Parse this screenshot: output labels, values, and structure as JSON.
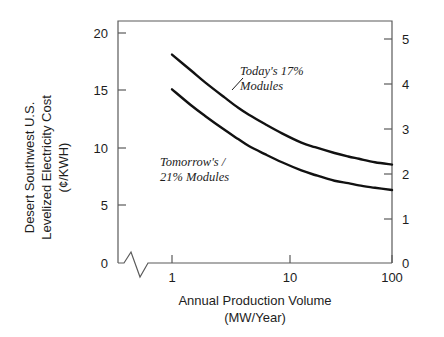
{
  "figure": {
    "axes": {
      "y_left_label_lines": [
        "Desert Southwest U.S.",
        "Levelized Electricity Cost",
        "(¢/KWH)"
      ],
      "x_label_lines": [
        "Annual Production Volume",
        "(MW/Year)"
      ],
      "y_left_ticks": [
        "0",
        "5",
        "10",
        "15",
        "20"
      ],
      "y_right_ticks": [
        "0",
        "1",
        "2",
        "3",
        "4",
        "5"
      ],
      "x_ticks": [
        "1",
        "10",
        "100"
      ]
    },
    "annotations": {
      "today_line1": "Today's 17%",
      "today_line2": "Modules",
      "tomorrow_line1": "Tomorrow's  /",
      "tomorrow_line2": "21% Modules"
    },
    "colors": {
      "ink": "#1a1a1a",
      "axis": "#555555",
      "background": "#ffffff"
    }
  },
  "chart_data": {
    "type": "line",
    "title": "",
    "xlabel": "Annual Production Volume (MW/Year)",
    "ylabel": "Desert Southwest U.S. Levelized Electricity Cost (¢/KWH)",
    "xscale": "log",
    "xlim": [
      1,
      100
    ],
    "ylim": [
      0,
      20
    ],
    "y2lim": [
      0,
      5
    ],
    "y2label": "",
    "xticks": [
      1,
      10,
      100
    ],
    "yticks": [
      0,
      5,
      10,
      15,
      20
    ],
    "y2ticks": [
      0,
      1,
      2,
      3,
      4,
      5
    ],
    "grid": false,
    "legend": "annotations-inline",
    "axis_break": {
      "axis": "x",
      "near": "origin",
      "style": "zigzag"
    },
    "x": [
      1,
      1.5,
      2,
      3,
      4,
      5,
      7,
      10,
      15,
      20,
      30,
      40,
      50,
      70,
      100
    ],
    "series": [
      {
        "name": "Today's 17% Modules",
        "values": [
          18.0,
          16.6,
          15.6,
          14.3,
          13.4,
          12.8,
          12.0,
          11.2,
          10.4,
          10.0,
          9.5,
          9.2,
          9.0,
          8.7,
          8.5
        ]
      },
      {
        "name": "Tomorrow's 21% Modules",
        "values": [
          15.0,
          13.6,
          12.7,
          11.5,
          10.7,
          10.1,
          9.4,
          8.7,
          8.0,
          7.6,
          7.1,
          6.9,
          6.7,
          6.5,
          6.3
        ]
      }
    ]
  }
}
